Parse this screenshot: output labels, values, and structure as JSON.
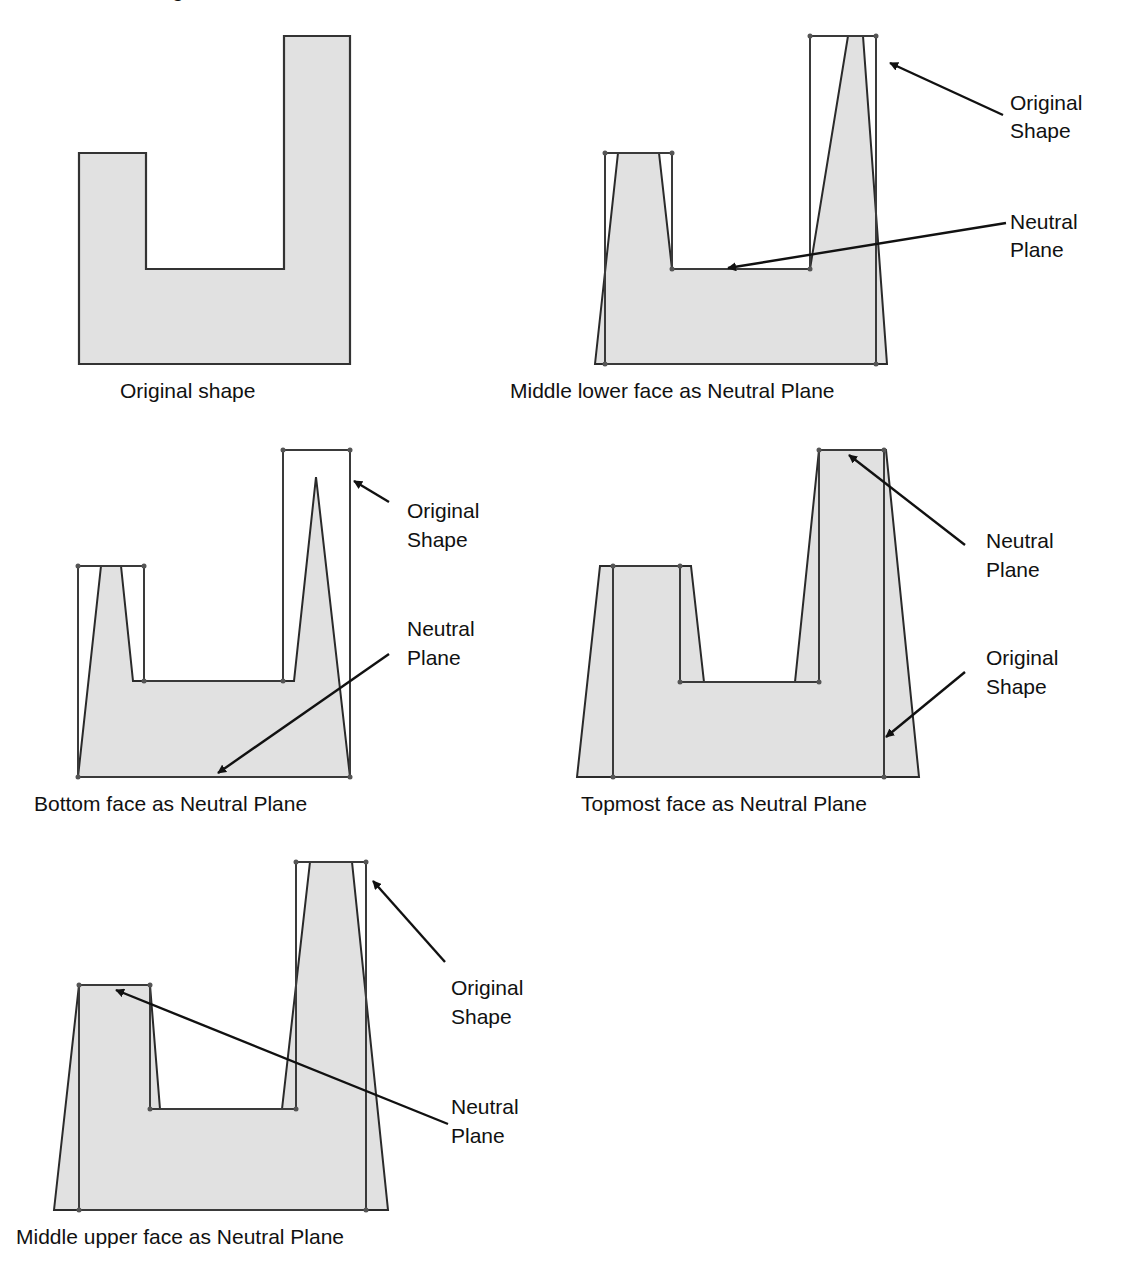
{
  "figure": {
    "cut_off_top_caption": "g"
  },
  "panels": [
    {
      "id": "original",
      "caption": "Original shape",
      "labels": []
    },
    {
      "id": "middle-lower",
      "caption": "Middle lower face as Neutral Plane",
      "labels": [
        {
          "line1": "Original",
          "line2": "Shape",
          "points_to": "original-shape-outline"
        },
        {
          "line1": "Neutral",
          "line2": "Plane",
          "points_to": "middle-lower-face"
        }
      ]
    },
    {
      "id": "bottom",
      "caption": "Bottom face as Neutral Plane",
      "labels": [
        {
          "line1": "Original",
          "line2": "Shape",
          "points_to": "original-shape-outline"
        },
        {
          "line1": "Neutral",
          "line2": "Plane",
          "points_to": "bottom-face"
        }
      ]
    },
    {
      "id": "topmost",
      "caption": "Topmost face as Neutral Plane",
      "labels": [
        {
          "line1": "Neutral",
          "line2": "Plane",
          "points_to": "topmost-face"
        },
        {
          "line1": "Original",
          "line2": "Shape",
          "points_to": "original-shape-outline"
        }
      ]
    },
    {
      "id": "middle-upper",
      "caption": "Middle upper face as Neutral Plane",
      "labels": [
        {
          "line1": "Original",
          "line2": "Shape",
          "points_to": "original-shape-outline"
        },
        {
          "line1": "Neutral",
          "line2": "Plane",
          "points_to": "middle-upper-face"
        }
      ]
    }
  ],
  "colors": {
    "shape_fill": "#e1e1e1",
    "outline": "#333333",
    "text": "#111111",
    "background": "#ffffff"
  }
}
